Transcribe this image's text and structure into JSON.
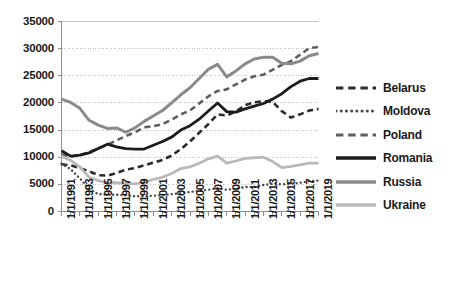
{
  "chart_data": {
    "type": "line",
    "title": "",
    "xlabel": "",
    "ylabel": "",
    "ylim": [
      0,
      35000
    ],
    "yticks": [
      0,
      5000,
      10000,
      15000,
      20000,
      25000,
      30000,
      35000
    ],
    "ytick_labels": [
      "0",
      "5000",
      "10000",
      "15000",
      "20000",
      "25000",
      "30000",
      "35000"
    ],
    "grid": true,
    "legend_position": "right",
    "x": [
      "1/1/1991",
      "1/1/1992",
      "1/1/1993",
      "1/1/1994",
      "1/1/1995",
      "1/1/1996",
      "1/1/1997",
      "1/1/1998",
      "1/1/1999",
      "1/1/2000",
      "1/1/2001",
      "1/1/2002",
      "1/1/2003",
      "1/1/2004",
      "1/1/2005",
      "1/1/2006",
      "1/1/2007",
      "1/1/2008",
      "1/1/2009",
      "1/1/2010",
      "1/1/2011",
      "1/1/2012",
      "1/1/2013",
      "1/1/2014",
      "1/1/2015",
      "1/1/2016",
      "1/1/2017",
      "1/1/2018",
      "1/1/2019"
    ],
    "xtick_labels": [
      "1/1/1991",
      "1/1/1993",
      "1/1/1995",
      "1/1/1997",
      "1/1/1999",
      "1/1/2001",
      "1/1/2003",
      "1/1/2005",
      "1/1/2007",
      "1/1/2009",
      "1/1/2011",
      "1/1/2013",
      "1/1/2015",
      "1/1/2017",
      "1/1/2019"
    ],
    "series": [
      {
        "name": "Belarus",
        "style": "dashed",
        "color": "#2b2b2b",
        "width": 2.6,
        "values": [
          8700,
          8500,
          8000,
          7400,
          6700,
          6600,
          7100,
          7700,
          8000,
          8500,
          9000,
          9500,
          10300,
          11500,
          12900,
          14500,
          16100,
          17900,
          17700,
          18400,
          19600,
          20100,
          20300,
          20200,
          18500,
          17300,
          17900,
          18600,
          18900
        ]
      },
      {
        "name": "Moldova",
        "style": "dotted",
        "color": "#4a4a4a",
        "width": 2.4,
        "values": [
          8800,
          7800,
          6100,
          4200,
          3200,
          3100,
          3100,
          3000,
          2800,
          2800,
          2900,
          3000,
          3200,
          3400,
          3600,
          3800,
          4000,
          4300,
          4000,
          4200,
          4500,
          4500,
          4900,
          5100,
          5000,
          5100,
          5300,
          5600,
          5700
        ]
      },
      {
        "name": "Poland",
        "style": "dashed",
        "color": "#5e5e5e",
        "width": 2.6,
        "values": [
          10500,
          10100,
          10400,
          10900,
          11600,
          12300,
          13100,
          13900,
          14600,
          15500,
          15700,
          16100,
          16900,
          17900,
          18600,
          19900,
          21200,
          22200,
          22500,
          23400,
          24300,
          24900,
          25200,
          26100,
          27000,
          27700,
          28900,
          30100,
          30300
        ]
      },
      {
        "name": "Romania",
        "style": "solid",
        "color": "#1c1c1c",
        "width": 2.8,
        "values": [
          11200,
          10200,
          10400,
          10800,
          11600,
          12400,
          11900,
          11600,
          11500,
          11500,
          12200,
          12900,
          13700,
          15000,
          15800,
          17000,
          18500,
          20000,
          18400,
          18300,
          18900,
          19400,
          19900,
          20700,
          21700,
          23000,
          24000,
          24500,
          24500
        ]
      },
      {
        "name": "Russia",
        "style": "solid",
        "color": "#8a8a8a",
        "width": 3.0,
        "values": [
          20700,
          20100,
          19000,
          16800,
          15900,
          15300,
          15400,
          14600,
          15400,
          16600,
          17600,
          18600,
          20000,
          21500,
          22800,
          24500,
          26200,
          27100,
          24800,
          25900,
          27200,
          28100,
          28400,
          28400,
          27300,
          27200,
          27700,
          28700,
          29100
        ]
      },
      {
        "name": "Ukraine",
        "style": "solid",
        "color": "#b9b9b9",
        "width": 2.8,
        "values": [
          10200,
          9400,
          8200,
          6300,
          5700,
          5300,
          5300,
          5200,
          5100,
          5400,
          5900,
          6300,
          7000,
          7900,
          8200,
          8900,
          9700,
          10200,
          8900,
          9300,
          9800,
          9900,
          10000,
          9200,
          8100,
          8300,
          8600,
          8900,
          8900
        ]
      }
    ]
  },
  "legend": {
    "items": [
      {
        "label": "Belarus"
      },
      {
        "label": "Moldova"
      },
      {
        "label": "Poland"
      },
      {
        "label": "Romania"
      },
      {
        "label": "Russia"
      },
      {
        "label": "Ukraine"
      }
    ]
  }
}
